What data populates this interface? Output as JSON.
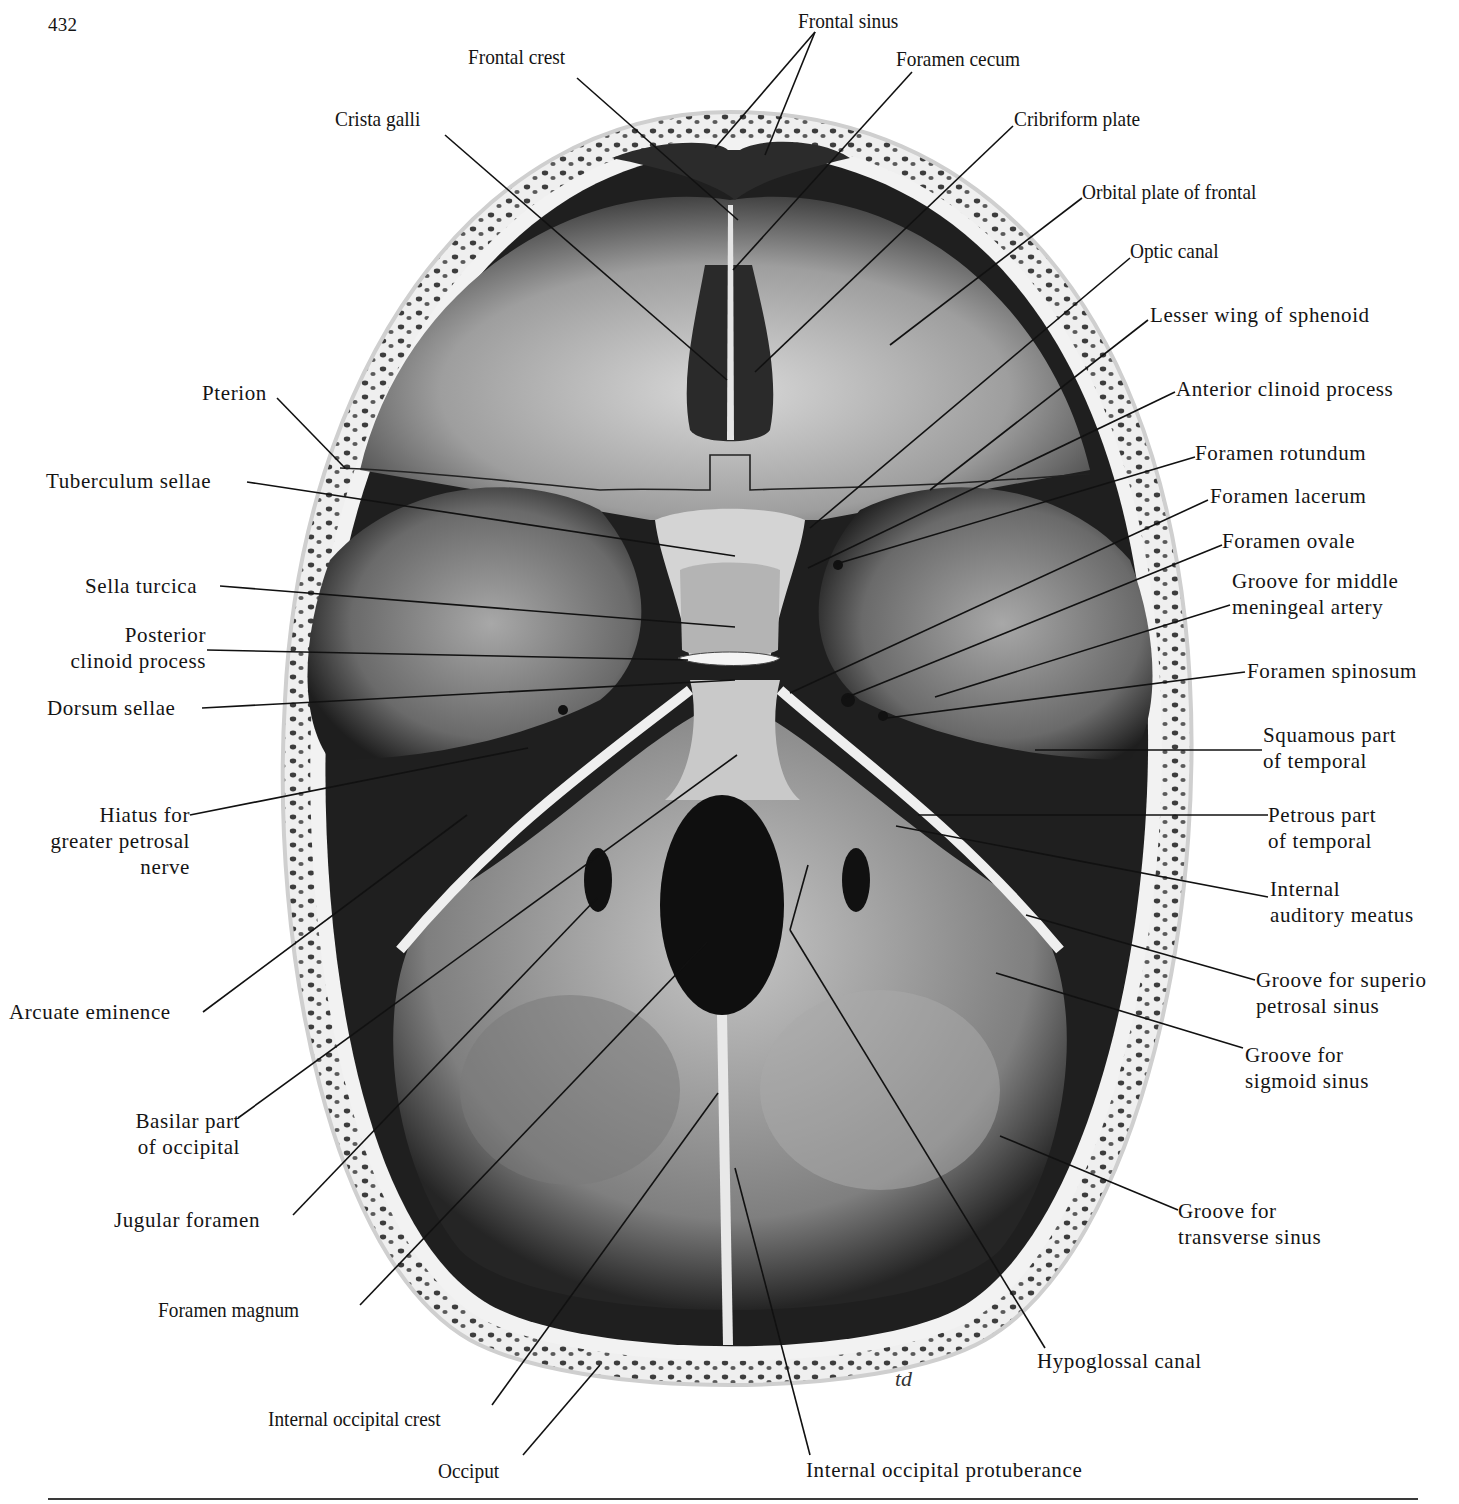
{
  "page": {
    "number": "432",
    "artist_signature": "td"
  },
  "figure": {
    "colors": {
      "ink": "#141414",
      "bone_light": "#e6e6e6",
      "bone_mid": "#9a9a9a",
      "cavity_dark": "#1c1c1c",
      "diploe": "#4a4a4a"
    }
  },
  "labels": {
    "frontal_sinus": "Frontal sinus",
    "frontal_crest": "Frontal crest",
    "foramen_cecum": "Foramen cecum",
    "crista_galli": "Crista galli",
    "cribriform_plate": "Cribriform plate",
    "orbital_plate_of_frontal": "Orbital plate of frontal",
    "optic_canal": "Optic canal",
    "lesser_wing_of_sphenoid": "Lesser wing of sphenoid",
    "pterion": "Pterion",
    "anterior_clinoid_process": "Anterior clinoid process",
    "tuberculum_sellae": "Tuberculum sellae",
    "foramen_rotundum": "Foramen rotundum",
    "foramen_lacerum": "Foramen lacerum",
    "foramen_ovale": "Foramen ovale",
    "sella_turcica": "Sella turcica",
    "groove_middle_meningeal_1": "Groove for middle",
    "groove_middle_meningeal_2": "meningeal artery",
    "posterior_clinoid_1": "Posterior",
    "posterior_clinoid_2": "clinoid process",
    "foramen_spinosum": "Foramen spinosum",
    "dorsum_sellae": "Dorsum sellae",
    "squamous_temporal_1": "Squamous part",
    "squamous_temporal_2": "of temporal",
    "hiatus_1": "Hiatus for",
    "hiatus_2": "greater petrosal",
    "hiatus_3": "nerve",
    "petrous_temporal_1": "Petrous part",
    "petrous_temporal_2": "of temporal",
    "internal_auditory_1": "Internal",
    "internal_auditory_2": "auditory meatus",
    "groove_sup_petrosal_1": "Groove for superio",
    "groove_sup_petrosal_2": "petrosal sinus",
    "arcuate_eminence": "Arcuate eminence",
    "groove_sigmoid_1": "Groove for",
    "groove_sigmoid_2": "sigmoid sinus",
    "basilar_occipital_1": "Basilar part",
    "basilar_occipital_2": "of occipital",
    "groove_transverse_1": "Groove for",
    "groove_transverse_2": "transverse sinus",
    "jugular_foramen": "Jugular foramen",
    "foramen_magnum": "Foramen magnum",
    "hypoglossal_canal": "Hypoglossal canal",
    "internal_occipital_crest": "Internal occipital crest",
    "occiput": "Occiput",
    "internal_occipital_protuberance": "Internal occipital protuberance"
  }
}
